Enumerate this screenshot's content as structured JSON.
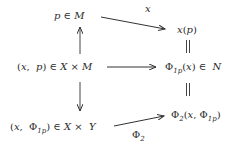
{
  "diagram": {
    "type": "commutative-diagram",
    "nodes": {
      "top_left": "p ∈ M",
      "top_right": "x(p)",
      "mid_left": "(x, p) ∈ X × M",
      "mid_right": "Φ1p(x) ∈ N",
      "bottom_left": "(x, Φ1p) ∈ X × Y",
      "bottom_right": "Φ2(x, Φ1p)"
    },
    "edges": [
      {
        "from": "top_left",
        "to": "top_right",
        "label": "x",
        "style": "arrow"
      },
      {
        "from": "mid_left",
        "to": "top_left",
        "label": "",
        "style": "arrow"
      },
      {
        "from": "mid_left",
        "to": "mid_right",
        "label": "",
        "style": "arrow"
      },
      {
        "from": "mid_left",
        "to": "bottom_left",
        "label": "",
        "style": "arrow"
      },
      {
        "from": "top_right",
        "to": "mid_right",
        "label": "",
        "style": "equality"
      },
      {
        "from": "mid_right",
        "to": "bottom_right",
        "label": "",
        "style": "equality"
      },
      {
        "from": "bottom_left",
        "to": "bottom_right",
        "label": "Φ2",
        "style": "arrow"
      }
    ],
    "edge_labels": {
      "top_arrow": "x",
      "bottom_arrow_main": "Φ",
      "bottom_arrow_sub": "2"
    },
    "parts": {
      "top_left": {
        "a": "p",
        "in": "∈",
        "b": "M"
      },
      "top_right": {
        "f": "x",
        "open": "(",
        "arg": "p",
        "close": ")"
      },
      "mid_left": {
        "open": "(",
        "a": "x",
        "sep": ",",
        "b": "p",
        "close": ")",
        "in": "∈",
        "c": "X",
        "times": "×",
        "d": "M"
      },
      "mid_right": {
        "phi": "Φ",
        "sub": "1p",
        "open": "(",
        "arg": "x",
        "close": ")",
        "in": "∈",
        "set": "N"
      },
      "bottom_left": {
        "open": "(",
        "a": "x",
        "sep": ",",
        "phi": "Φ",
        "sub": "1p",
        "close": ")",
        "in": "∈",
        "c": "X",
        "times": "×",
        "d": "Y"
      },
      "bottom_right": {
        "phi": "Φ",
        "sub": "2",
        "open": "(",
        "a": "x",
        "sep": ",",
        "phi2": "Φ",
        "sub2": "1p",
        "close": ")"
      }
    },
    "colors": {
      "ink": "#2a2a2a",
      "background": "#ffffff"
    }
  }
}
